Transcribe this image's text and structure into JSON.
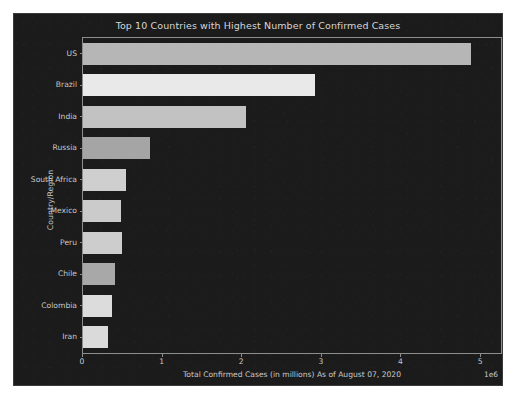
{
  "figure": {
    "background_color": "#1b1b1b",
    "page_background_color": "#ffffff",
    "axis_color": "#8d8d8d",
    "text_color": "#c9c9c9"
  },
  "chart_data": {
    "type": "bar",
    "orientation": "horizontal",
    "title": "Top 10 Countries with Highest Number of Confirmed Cases",
    "xlabel": "Total Confirmed Cases (in millions) As of August 07, 2020",
    "ylabel": "Country/Region",
    "categories": [
      "US",
      "Brazil",
      "India",
      "Russia",
      "South Africa",
      "Mexico",
      "Peru",
      "Chile",
      "Colombia",
      "Iran"
    ],
    "values": [
      4870000,
      2910000,
      2050000,
      840000,
      540000,
      475000,
      490000,
      400000,
      360000,
      320000
    ],
    "bar_colors": [
      "#b6b6b6",
      "#e9e9e9",
      "#c2c2c2",
      "#a5a5a5",
      "#cfcfcf",
      "#cbcbcb",
      "#cdcdcd",
      "#a8a8a8",
      "#dcdcdc",
      "#dadada"
    ],
    "xlim": [
      0,
      5250000
    ],
    "xticks": [
      0,
      1000000,
      2000000,
      3000000,
      4000000,
      5000000
    ],
    "xtick_labels": [
      "0",
      "1",
      "2",
      "3",
      "4",
      "5"
    ],
    "x_offset_text": "1e6",
    "grid": false,
    "legend": null
  }
}
